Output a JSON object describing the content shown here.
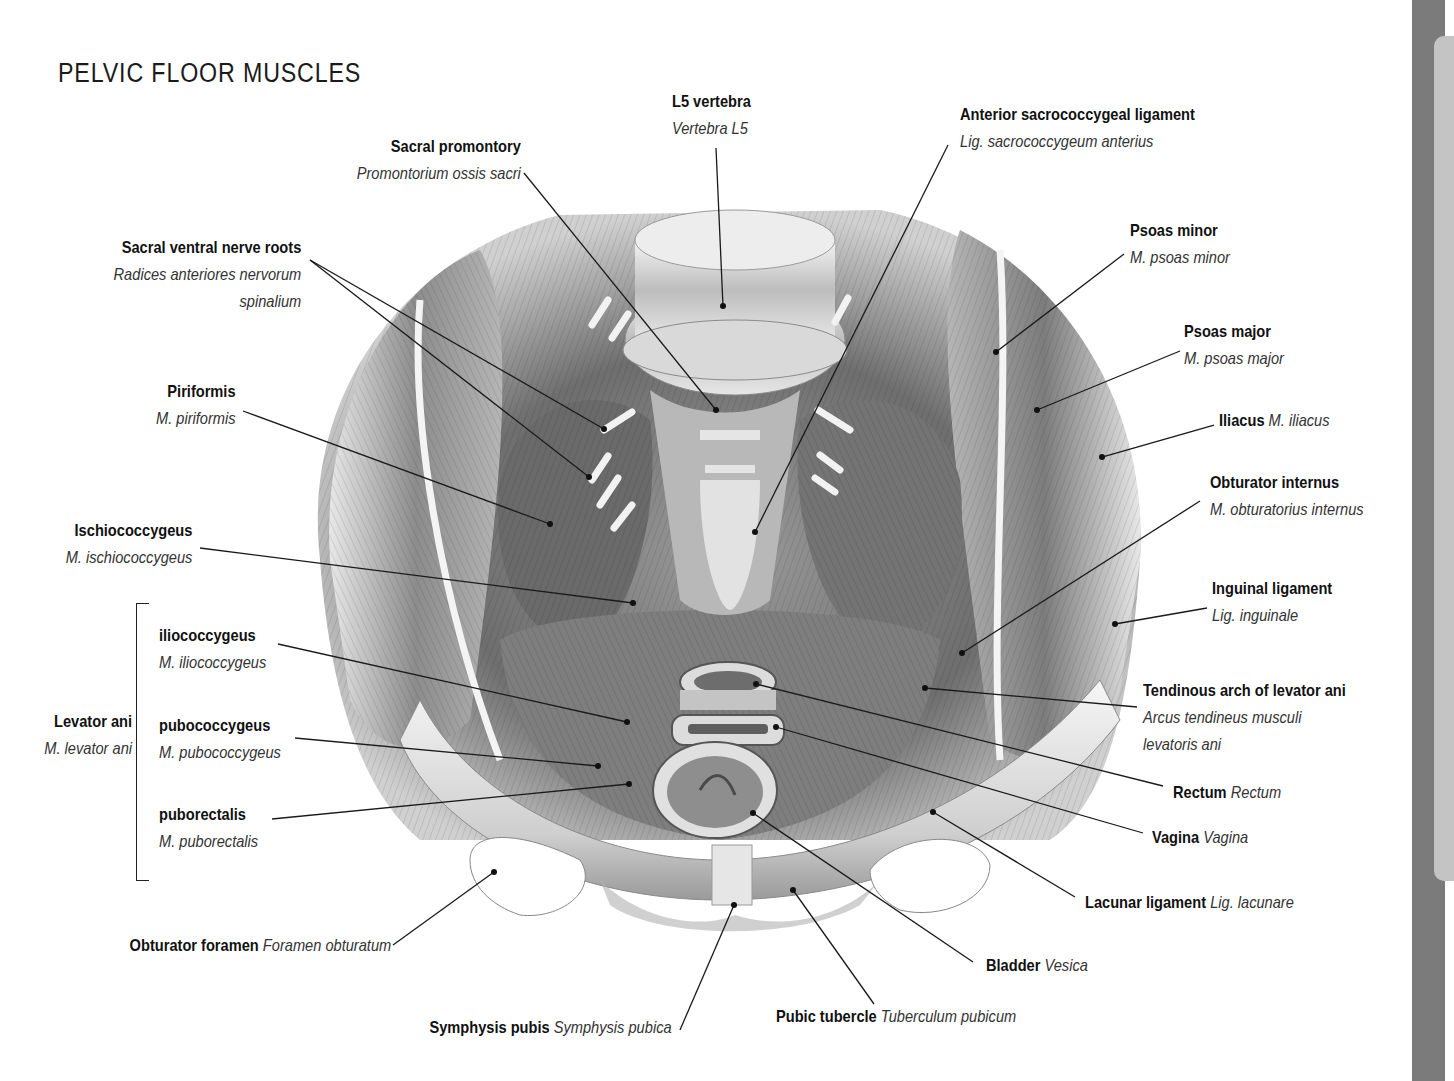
{
  "page": {
    "title": "PELVIC FLOOR MUSCLES"
  },
  "labels": {
    "l5_vertebra": {
      "en": "L5 vertebra",
      "la": "Vertebra L5"
    },
    "sacral_promontory": {
      "en": "Sacral promontory",
      "la": "Promontorium ossis sacri"
    },
    "anterior_sacrococcygeal_ligament": {
      "en": "Anterior sacrococcygeal ligament",
      "la": "Lig. sacrococcygeum anterius"
    },
    "sacral_ventral_nerve_roots": {
      "en": "Sacral ventral nerve roots",
      "la1": "Radices anteriores nervorum",
      "la2": "spinalium"
    },
    "psoas_minor": {
      "en": "Psoas minor",
      "la": "M. psoas minor"
    },
    "psoas_major": {
      "en": "Psoas major",
      "la": "M. psoas major"
    },
    "piriformis": {
      "en": "Piriformis",
      "la": "M. piriformis"
    },
    "iliacus": {
      "en": "Iliacus",
      "la": "M. iliacus"
    },
    "obturator_internus": {
      "en": "Obturator internus",
      "la": "M. obturatorius internus"
    },
    "ischiococcygeus": {
      "en": "Ischiococcygeus",
      "la": "M. ischiococcygeus"
    },
    "inguinal_ligament": {
      "en": "Inguinal ligament",
      "la": "Lig. inguinale"
    },
    "levator_ani": {
      "en": "Levator ani",
      "la": "M. levator ani"
    },
    "iliococcygeus": {
      "en": "iliococcygeus",
      "la": "M. iliococcygeus"
    },
    "pubococcygeus": {
      "en": "pubococcygeus",
      "la": "M. pubococcygeus"
    },
    "puborectalis": {
      "en": "puborectalis",
      "la": "M. puborectalis"
    },
    "tendinous_arch": {
      "en": "Tendinous arch of levator ani",
      "la1": "Arcus tendineus musculi",
      "la2": "levatoris ani"
    },
    "rectum": {
      "en": "Rectum",
      "la": "Rectum"
    },
    "vagina": {
      "en": "Vagina",
      "la": "Vagina"
    },
    "lacunar_ligament": {
      "en": "Lacunar ligament",
      "la": "Lig. lacunare"
    },
    "obturator_foramen": {
      "en": "Obturator foramen",
      "la": "Foramen obturatum"
    },
    "bladder": {
      "en": "Bladder",
      "la": "Vesica"
    },
    "symphysis_pubis": {
      "en": "Symphysis pubis",
      "la": "Symphysis pubica"
    },
    "pubic_tubercle": {
      "en": "Pubic tubercle",
      "la": "Tuberculum pubicum"
    }
  },
  "colors": {
    "line": "#1a1a1a",
    "sidebar": "#7b7b7b",
    "sidebar_tab": "#c4c4c4"
  }
}
